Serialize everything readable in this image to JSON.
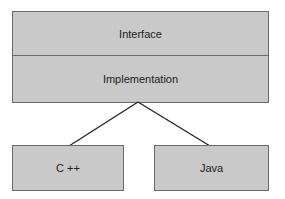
{
  "diagram": {
    "layers": [
      {
        "label": "Interface"
      },
      {
        "label": "Implementation"
      }
    ],
    "children": [
      {
        "label": "C ++"
      },
      {
        "label": "Java"
      }
    ],
    "colors": {
      "fill": "#c9c9c9",
      "stroke": "#6a6a6a",
      "line": "#222222"
    }
  }
}
